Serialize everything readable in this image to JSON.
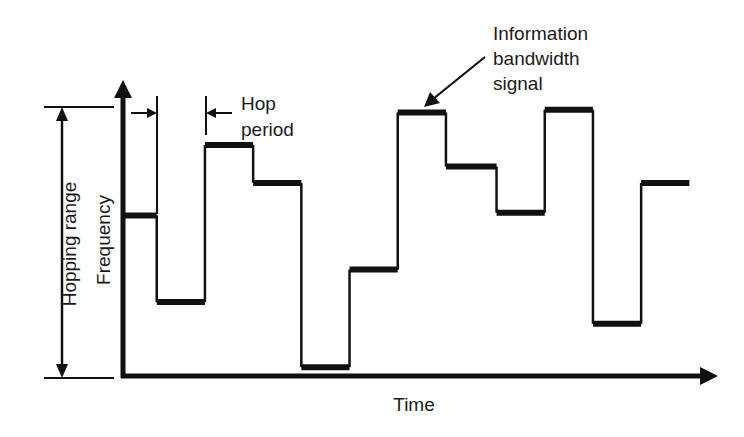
{
  "colors": {
    "ink": "#111111",
    "background": "#ffffff"
  },
  "labels": {
    "x_axis": "Time",
    "y_axis": "Frequency",
    "hopping_range": "Hopping range",
    "hop_period_line1": "Hop",
    "hop_period_line2": "period",
    "info_line1": "Information",
    "info_line2": "bandwidth",
    "info_line3": "signal"
  },
  "chart_data": {
    "type": "line",
    "style": "step",
    "title": "",
    "xlabel": "Time",
    "ylabel": "Frequency",
    "ylim": [
      0,
      1
    ],
    "x_unit": "hop periods",
    "y_unit": "fraction of hopping range",
    "hops": [
      {
        "index": 1,
        "frequency": 0.6,
        "duration": 0.7
      },
      {
        "index": 2,
        "frequency": 0.28,
        "duration": 1.0
      },
      {
        "index": 3,
        "frequency": 0.86,
        "duration": 1.0
      },
      {
        "index": 4,
        "frequency": 0.72,
        "duration": 1.0
      },
      {
        "index": 5,
        "frequency": 0.04,
        "duration": 1.0
      },
      {
        "index": 6,
        "frequency": 0.4,
        "duration": 1.0
      },
      {
        "index": 7,
        "frequency": 0.98,
        "duration": 1.0
      },
      {
        "index": 8,
        "frequency": 0.78,
        "duration": 1.05
      },
      {
        "index": 9,
        "frequency": 0.61,
        "duration": 1.0
      },
      {
        "index": 10,
        "frequency": 0.99,
        "duration": 1.0
      },
      {
        "index": 11,
        "frequency": 0.2,
        "duration": 1.0
      },
      {
        "index": 12,
        "frequency": 0.72,
        "duration": 1.0
      }
    ],
    "annotations": [
      {
        "text": "Hop period",
        "target": "hop 2 width (between hop 1 end and hop 3 start)"
      },
      {
        "text": "Information bandwidth signal",
        "target": "hop 7"
      },
      {
        "text": "Hopping range",
        "target": "full frequency span"
      }
    ],
    "grid": false,
    "legend": "none"
  }
}
